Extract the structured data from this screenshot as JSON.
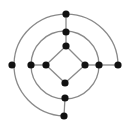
{
  "diagram": {
    "type": "graph",
    "colors": {
      "edge": "#8a8a8a",
      "node": "#111111",
      "background": "#ffffff"
    },
    "center": [
      65,
      65
    ],
    "outer_radius": 51,
    "middle_radius": 34,
    "nodes": [
      {
        "id": "outer-top",
        "x": 66,
        "y": 14
      },
      {
        "id": "outer-left",
        "x": 12,
        "y": 65
      },
      {
        "id": "outer-right",
        "x": 118,
        "y": 65
      },
      {
        "id": "outer-bottom",
        "x": 64,
        "y": 116
      },
      {
        "id": "mid-top",
        "x": 66,
        "y": 32
      },
      {
        "id": "mid-left",
        "x": 31,
        "y": 65
      },
      {
        "id": "mid-right",
        "x": 99,
        "y": 65
      },
      {
        "id": "mid-bottom",
        "x": 65,
        "y": 98
      },
      {
        "id": "in-top",
        "x": 66,
        "y": 46
      },
      {
        "id": "in-left",
        "x": 46,
        "y": 65
      },
      {
        "id": "in-right",
        "x": 85,
        "y": 65
      },
      {
        "id": "in-bottom",
        "x": 65,
        "y": 83
      }
    ],
    "line_edges": [
      [
        "outer-top",
        "mid-top"
      ],
      [
        "mid-top",
        "in-top"
      ],
      [
        "mid-left",
        "in-left"
      ],
      [
        "in-right",
        "mid-right"
      ],
      [
        "mid-right",
        "outer-right"
      ],
      [
        "mid-bottom",
        "outer-bottom"
      ],
      [
        "in-top",
        "in-right"
      ],
      [
        "in-right",
        "in-bottom"
      ],
      [
        "in-bottom",
        "in-left"
      ],
      [
        "in-left",
        "in-top"
      ]
    ]
  }
}
